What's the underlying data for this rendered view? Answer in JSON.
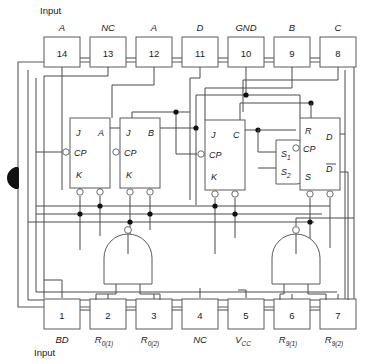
{
  "figure": {
    "top_caption": "Input",
    "bottom_caption": "Input",
    "device_kind": "decade-counter-ic-logic-diagram",
    "package_notch": "pin-1-notch-marker"
  },
  "top_pins": [
    {
      "number": "14",
      "label": "A"
    },
    {
      "number": "13",
      "label": "NC"
    },
    {
      "number": "12",
      "label": "A"
    },
    {
      "number": "11",
      "label": "D"
    },
    {
      "number": "10",
      "label": "GND"
    },
    {
      "number": "9",
      "label": "B"
    },
    {
      "number": "8",
      "label": "C"
    }
  ],
  "bottom_pins": [
    {
      "number": "1",
      "label": "BD",
      "sub": ""
    },
    {
      "number": "2",
      "label": "R",
      "sub": "0(1)"
    },
    {
      "number": "3",
      "label": "R",
      "sub": "0(2)"
    },
    {
      "number": "4",
      "label": "NC",
      "sub": ""
    },
    {
      "number": "5",
      "label": "V",
      "sub": "CC"
    },
    {
      "number": "6",
      "label": "R",
      "sub": "9(1)"
    },
    {
      "number": "7",
      "label": "R",
      "sub": "9(2)"
    }
  ],
  "flipflops": [
    {
      "name": "ff-a",
      "in_top": "J",
      "in_clk": "CP",
      "in_bot": "K",
      "out": "A"
    },
    {
      "name": "ff-b",
      "in_top": "J",
      "in_clk": "CP",
      "in_bot": "K",
      "out": "B"
    },
    {
      "name": "ff-c",
      "in_top": "J",
      "in_clk": "CP",
      "in_bot": "K",
      "out": "C"
    },
    {
      "name": "ff-d",
      "in_top": "R",
      "in_clk": "CP",
      "in_bot": "S",
      "out": "D",
      "out2": "D"
    }
  ],
  "and_gate": {
    "name": "steering-and-gate",
    "input_1": "S",
    "input_1_sub": "1",
    "input_2": "S",
    "input_2_sub": "2"
  },
  "nand_gates": [
    {
      "name": "reset-0-nand-gate",
      "inputs": 2
    },
    {
      "name": "reset-9-nand-gate",
      "inputs": 2
    }
  ],
  "colors": {
    "wire": "#4a4a4a",
    "outline": "#5a5a5a",
    "text": "#1a1a1a",
    "junction": "#111111",
    "background": "#ffffff"
  }
}
